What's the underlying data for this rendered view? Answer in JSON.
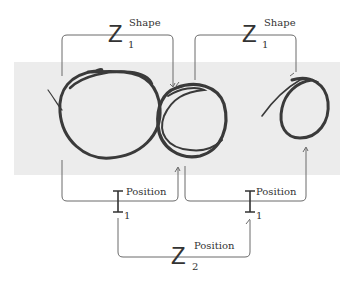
{
  "diagram": {
    "type": "sketch-comparison-graph",
    "background_band_color": "#ececec",
    "stroke_color": "#3a3a3a",
    "connector_color": "#6a6a6a",
    "nodes": [
      {
        "id": "circle-1",
        "label": "hand-drawn circle (left)"
      },
      {
        "id": "circle-2",
        "label": "hand-drawn circle (middle)"
      },
      {
        "id": "circle-3",
        "label": "hand-drawn circle (right)"
      }
    ],
    "relations": [
      {
        "id": "shape-left",
        "symbol": "Z",
        "superscript": "Shape",
        "subscript": "1",
        "connects": [
          "circle-1",
          "circle-2"
        ],
        "side": "top"
      },
      {
        "id": "shape-right",
        "symbol": "Z",
        "superscript": "Shape",
        "subscript": "1",
        "connects": [
          "circle-2",
          "circle-3"
        ],
        "side": "top"
      },
      {
        "id": "position-left",
        "symbol": "I",
        "superscript": "Position",
        "subscript": "1",
        "connects": [
          "circle-1",
          "circle-2"
        ],
        "side": "bottom"
      },
      {
        "id": "position-right",
        "symbol": "I",
        "superscript": "Position",
        "subscript": "1",
        "connects": [
          "circle-2",
          "circle-3"
        ],
        "side": "bottom"
      },
      {
        "id": "position-combined",
        "symbol": "Z",
        "superscript": "Position",
        "subscript": "2",
        "connects": [
          "position-left",
          "position-right"
        ],
        "side": "bottom"
      }
    ]
  }
}
